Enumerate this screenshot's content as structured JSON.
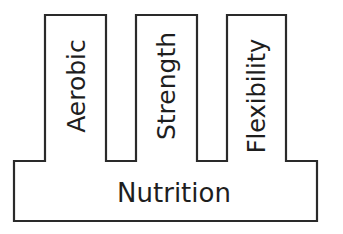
{
  "diagram": {
    "type": "pillars-on-foundation",
    "stroke_color": "#2a2a2a",
    "fill_color": "#ffffff",
    "text_color": "#1e1e1e",
    "pillars": [
      {
        "label": "Aerobic"
      },
      {
        "label": "Strength"
      },
      {
        "label": "Flexibility"
      }
    ],
    "foundation": {
      "label": "Nutrition"
    }
  }
}
